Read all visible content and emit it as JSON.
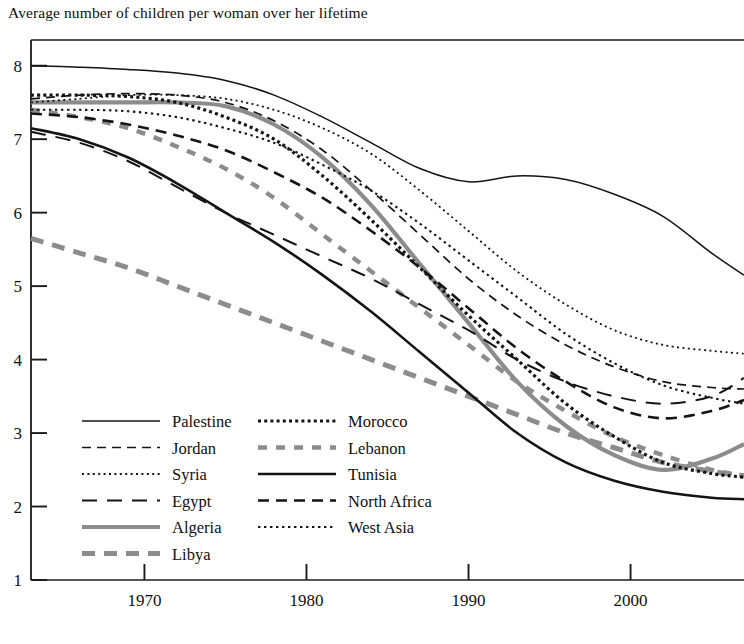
{
  "chart_data": {
    "type": "line",
    "title": "Average number of children per woman over her lifetime",
    "xlabel": "",
    "ylabel": "",
    "xlim": [
      1963,
      2007
    ],
    "ylim": [
      1,
      8.35
    ],
    "grid": false,
    "legend_position": "inside-bottom-left",
    "x_ticks": [
      "1970",
      "1980",
      "1990",
      "2000"
    ],
    "x_tick_values": [
      1970,
      1980,
      1990,
      2000
    ],
    "y_ticks": [
      "1",
      "2",
      "3",
      "4",
      "5",
      "6",
      "7",
      "8"
    ],
    "y_tick_values": [
      1,
      2,
      3,
      4,
      5,
      6,
      7,
      8
    ],
    "x": [
      1963,
      1966,
      1969,
      1972,
      1975,
      1978,
      1981,
      1984,
      1987,
      1990,
      1993,
      1996,
      1999,
      2002,
      2005,
      2007
    ],
    "series": [
      {
        "name": "Palestine",
        "style": "solid-thin",
        "color": "#141414",
        "values": [
          8.0,
          7.98,
          7.95,
          7.9,
          7.8,
          7.6,
          7.3,
          6.95,
          6.6,
          6.42,
          6.5,
          6.45,
          6.25,
          5.95,
          5.45,
          5.15
        ]
      },
      {
        "name": "Jordan",
        "style": "dashed-medium",
        "color": "#141414",
        "values": [
          7.55,
          7.6,
          7.62,
          7.6,
          7.5,
          7.25,
          6.85,
          6.3,
          5.7,
          5.1,
          4.6,
          4.2,
          3.9,
          3.7,
          3.62,
          3.6
        ]
      },
      {
        "name": "Syria",
        "style": "dotted-fine",
        "color": "#141414",
        "values": [
          7.5,
          7.55,
          7.6,
          7.6,
          7.55,
          7.4,
          7.15,
          6.8,
          6.3,
          5.75,
          5.2,
          4.75,
          4.4,
          4.2,
          4.12,
          4.08
        ]
      },
      {
        "name": "Egypt",
        "style": "dashed-long",
        "color": "#141414",
        "values": [
          7.1,
          6.95,
          6.7,
          6.35,
          6.0,
          5.7,
          5.4,
          5.1,
          4.75,
          4.4,
          4.0,
          3.7,
          3.5,
          3.4,
          3.5,
          3.75
        ]
      },
      {
        "name": "Algeria",
        "style": "solid-thick-gray",
        "color": "#8c8c8c",
        "values": [
          7.5,
          7.5,
          7.5,
          7.5,
          7.45,
          7.2,
          6.75,
          6.1,
          5.3,
          4.5,
          3.7,
          3.1,
          2.7,
          2.5,
          2.65,
          2.85
        ]
      },
      {
        "name": "Libya",
        "style": "dashed-thick-gray",
        "color": "#8c8c8c",
        "values": [
          5.65,
          5.45,
          5.25,
          5.0,
          4.75,
          4.5,
          4.25,
          4.0,
          3.75,
          3.5,
          3.25,
          3.0,
          2.8,
          2.6,
          2.48,
          2.42
        ]
      },
      {
        "name": "Morocco",
        "style": "dotted-square",
        "color": "#141414",
        "values": [
          7.6,
          7.6,
          7.58,
          7.5,
          7.3,
          7.0,
          6.5,
          5.9,
          5.25,
          4.6,
          4.0,
          3.4,
          2.95,
          2.6,
          2.45,
          2.4
        ]
      },
      {
        "name": "Lebanon",
        "style": "dashed-thick-gray-short",
        "color": "#8c8c8c",
        "values": [
          7.4,
          7.3,
          7.15,
          6.9,
          6.6,
          6.2,
          5.7,
          5.2,
          4.7,
          4.2,
          3.7,
          3.3,
          2.95,
          2.7,
          2.5,
          2.42
        ]
      },
      {
        "name": "Tunisia",
        "style": "solid-medium",
        "color": "#141414",
        "values": [
          7.15,
          7.0,
          6.75,
          6.4,
          6.0,
          5.6,
          5.15,
          4.65,
          4.1,
          3.55,
          3.0,
          2.6,
          2.35,
          2.2,
          2.12,
          2.1
        ]
      },
      {
        "name": "North Africa",
        "style": "dashed-bold",
        "color": "#141414",
        "values": [
          7.35,
          7.3,
          7.2,
          7.05,
          6.85,
          6.55,
          6.2,
          5.75,
          5.25,
          4.7,
          4.15,
          3.7,
          3.35,
          3.2,
          3.3,
          3.45
        ]
      },
      {
        "name": "West Asia",
        "style": "dotted-medium",
        "color": "#141414",
        "values": [
          7.4,
          7.4,
          7.38,
          7.3,
          7.15,
          6.95,
          6.65,
          6.3,
          5.85,
          5.35,
          4.85,
          4.35,
          3.95,
          3.65,
          3.48,
          3.4
        ]
      }
    ]
  },
  "legend": {
    "column1": [
      "Palestine",
      "Jordan",
      "Syria",
      "Egypt",
      "Algeria",
      "Libya"
    ],
    "column2": [
      "Morocco",
      "Lebanon",
      "Tunisia",
      "North Africa",
      "West Asia"
    ]
  }
}
